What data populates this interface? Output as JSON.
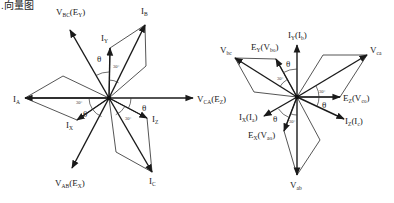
{
  "caption_fragment": "…向量图",
  "left_diagram": {
    "center": [
      109,
      98
    ],
    "vectors": [
      {
        "name": "V_BC(E_Y)",
        "main": "V",
        "sub": "BC",
        "paren_main": "E",
        "paren_sub": "Y",
        "tip": [
          70,
          30
        ],
        "label_pos": [
          56,
          15
        ],
        "heavy": true
      },
      {
        "name": "I_B",
        "main": "I",
        "sub": "B",
        "tip": [
          145,
          25
        ],
        "label_pos": [
          141,
          14
        ],
        "heavy": true
      },
      {
        "name": "I_Y",
        "main": "I",
        "sub": "Y",
        "tip": [
          110,
          48
        ],
        "label_pos": [
          101,
          41
        ],
        "heavy": true
      },
      {
        "name": "I_A",
        "main": "I",
        "sub": "A",
        "tip": [
          25,
          98
        ],
        "label_pos": [
          13,
          102
        ],
        "heavy": true
      },
      {
        "name": "V_CA(E_Z)",
        "main": "V",
        "sub": "CA",
        "paren_main": "E",
        "paren_sub": "Z",
        "tip": [
          193,
          98
        ],
        "label_pos": [
          197,
          102
        ],
        "heavy": true
      },
      {
        "name": "I_X",
        "main": "I",
        "sub": "X",
        "tip": [
          77,
          120
        ],
        "label_pos": [
          66,
          128
        ],
        "heavy": true
      },
      {
        "name": "V_AB(E_X)",
        "main": "V",
        "sub": "AB",
        "paren_main": "E",
        "paren_sub": "X",
        "tip": [
          72,
          168
        ],
        "label_pos": [
          55,
          186
        ],
        "heavy": true
      },
      {
        "name": "I_Z",
        "main": "I",
        "sub": "Z",
        "tip": [
          147,
          118
        ],
        "label_pos": [
          152,
          122
        ],
        "heavy": true
      },
      {
        "name": "I_C",
        "main": "I",
        "sub": "C",
        "tip": [
          152,
          172
        ],
        "label_pos": [
          149,
          184
        ],
        "heavy": true
      }
    ],
    "parallelograms": [
      [
        [
          109,
          98
        ],
        [
          110,
          48
        ],
        [
          145,
          25
        ],
        [
          146,
          66
        ]
      ],
      [
        [
          109,
          98
        ],
        [
          25,
          98
        ],
        [
          63,
          76
        ]
      ],
      [
        [
          109,
          98
        ],
        [
          77,
          120
        ],
        [
          25,
          98
        ]
      ],
      [
        [
          109,
          98
        ],
        [
          147,
          118
        ],
        [
          152,
          172
        ],
        [
          116,
          152
        ]
      ]
    ],
    "angle_labels": [
      {
        "text": "θ",
        "pos": [
          97,
          62
        ]
      },
      {
        "text": "30°",
        "pos": [
          113,
          68
        ]
      },
      {
        "text": "30°",
        "pos": [
          76,
          104
        ]
      },
      {
        "text": "θ",
        "pos": [
          83,
          117
        ]
      },
      {
        "text": "θ",
        "pos": [
          142,
          111
        ]
      },
      {
        "text": "30°",
        "pos": [
          125,
          120
        ]
      }
    ]
  },
  "right_diagram": {
    "center": [
      297,
      97
    ],
    "vectors": [
      {
        "name": "I_Y(I_b)",
        "main": "I",
        "sub": "Y",
        "paren_main": "I",
        "paren_sub": "b",
        "tip": [
          297,
          45
        ],
        "label_pos": [
          288,
          38
        ],
        "heavy": true
      },
      {
        "name": "V_bc",
        "main": "V",
        "sub": "bc",
        "tip": [
          235,
          58
        ],
        "label_pos": [
          220,
          53
        ],
        "heavy": true
      },
      {
        "name": "E_Y(V_bo)",
        "main": "E",
        "sub": "Y",
        "paren_main": "V",
        "paren_sub": "bo",
        "tip": [
          276,
          59
        ],
        "label_pos": [
          251,
          50
        ],
        "heavy": true
      },
      {
        "name": "V_ca",
        "main": "V",
        "sub": "ca",
        "tip": [
          367,
          55
        ],
        "label_pos": [
          370,
          53
        ],
        "heavy": true
      },
      {
        "name": "E_Z(V_co)",
        "main": "E",
        "sub": "Z",
        "paren_main": "V",
        "paren_sub": "co",
        "tip": [
          340,
          97
        ],
        "label_pos": [
          343,
          101
        ],
        "heavy": true
      },
      {
        "name": "I_Z(I_c)",
        "main": "I",
        "sub": "Z",
        "paren_main": "I",
        "paren_sub": "c",
        "tip": [
          344,
          119
        ],
        "label_pos": [
          345,
          124
        ],
        "heavy": true
      },
      {
        "name": "I_X(I_a)",
        "main": "I",
        "sub": "X",
        "paren_main": "I",
        "paren_sub": "a",
        "tip": [
          264,
          116
        ],
        "label_pos": [
          239,
          120
        ],
        "heavy": true
      },
      {
        "name": "E_X(V_ao)",
        "main": "E",
        "sub": "X",
        "paren_main": "V",
        "paren_sub": "ao",
        "tip": [
          284,
          131
        ],
        "label_pos": [
          248,
          138
        ],
        "heavy": true
      },
      {
        "name": "V_ab",
        "main": "V",
        "sub": "ab",
        "tip": [
          297,
          175
        ],
        "label_pos": [
          290,
          188
        ],
        "heavy": true
      }
    ],
    "parallelograms": [
      [
        [
          297,
          97
        ],
        [
          276,
          59
        ],
        [
          235,
          58
        ],
        [
          254,
          92
        ]
      ],
      [
        [
          297,
          97
        ],
        [
          340,
          97
        ],
        [
          367,
          55
        ],
        [
          323,
          55
        ]
      ],
      [
        [
          297,
          97
        ],
        [
          284,
          131
        ],
        [
          297,
          175
        ],
        [
          320,
          140
        ]
      ]
    ],
    "angle_labels": [
      {
        "text": "θ",
        "pos": [
          286,
          67
        ]
      },
      {
        "text": "30°",
        "pos": [
          277,
          80
        ]
      },
      {
        "text": "30°",
        "pos": [
          319,
          93
        ]
      },
      {
        "text": "θ",
        "pos": [
          322,
          108
        ]
      },
      {
        "text": "θ",
        "pos": [
          273,
          122
        ]
      },
      {
        "text": "30°",
        "pos": [
          289,
          123
        ]
      }
    ]
  }
}
